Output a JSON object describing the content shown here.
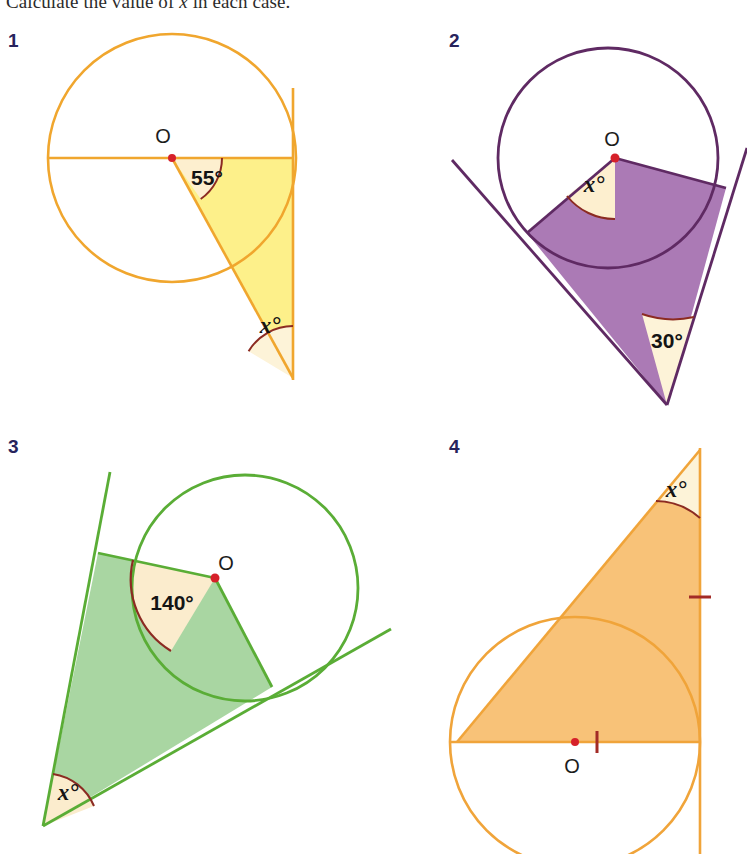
{
  "page": {
    "width": 747,
    "height": 854,
    "background": "#ffffff",
    "heading_part1": "Calculate the value of ",
    "heading_var": "x",
    "heading_part2": " in each case."
  },
  "palette": {
    "navy": "#27235c",
    "angle_arc": "#8c2b22",
    "angle_fill": "#fdefcf",
    "center_dot": "#d6212a",
    "tick_mark": "#a32b26",
    "orange_stroke": "#f0a62e",
    "orange_fill": "#fdf08a",
    "purple_stroke": "#5f2a63",
    "purple_fill": "#ab7ab5",
    "green_stroke": "#5aad36",
    "green_fill": "#a9d6a2",
    "orange4_stroke": "#f0a43a",
    "orange4_fill": "#f8c278"
  },
  "questions": [
    {
      "number": "1",
      "color_name": "orange",
      "center_label": "O",
      "known_angle": "55°",
      "unknown_angle": "x°",
      "geometry": {
        "circle": {
          "cx": 172,
          "cy": 158,
          "r": 124
        },
        "center": {
          "cx": 172,
          "cy": 158
        },
        "radius_horizontal_end": {
          "x": 48,
          "y": 158
        },
        "radius_tangentpoint": {
          "x": 293,
          "y": 158
        },
        "radius_angled_end": {
          "x": 273,
          "y": 260
        },
        "tangent_line": {
          "x1": 293,
          "y1": 88,
          "x2": 293,
          "y2": 380
        },
        "apex": {
          "x": 293,
          "y": 378
        },
        "known_angle_at": "centre",
        "known_angle_value": 55,
        "unknown_angle_at": "apex"
      }
    },
    {
      "number": "2",
      "color_name": "purple",
      "center_label": "O",
      "known_angle": "30°",
      "unknown_angle": "x°",
      "geometry": {
        "circle": {
          "cx": 608,
          "cy": 158,
          "r": 110
        },
        "center": {
          "cx": 615,
          "cy": 158
        },
        "tangent_point_left": {
          "x": 527,
          "y": 233
        },
        "tangent_point_right": {
          "x": 726,
          "y": 188
        },
        "apex": {
          "x": 667,
          "y": 405
        },
        "tangent_left_far": {
          "x": 452,
          "y": 160
        },
        "tangent_right_far": {
          "x": 747,
          "y": 150
        },
        "known_angle_at": "apex",
        "known_angle_value": 30,
        "unknown_angle_at": "centre"
      }
    },
    {
      "number": "3",
      "color_name": "green",
      "center_label": "O",
      "known_angle": "140°",
      "unknown_angle": "x°",
      "geometry": {
        "circle": {
          "cx": 245,
          "cy": 588,
          "r": 113
        },
        "center": {
          "cx": 215,
          "cy": 578
        },
        "tangent_point_left": {
          "x": 98,
          "y": 553
        },
        "tangent_point_right": {
          "x": 272,
          "y": 687
        },
        "apex": {
          "x": 43,
          "y": 826
        },
        "tangent_left_far": {
          "x": 110,
          "y": 472
        },
        "tangent_right_far": {
          "x": 391,
          "y": 633
        },
        "known_angle_at": "centre",
        "known_angle_value": 140,
        "unknown_angle_at": "apex"
      }
    },
    {
      "number": "4",
      "color_name": "orange",
      "center_label": "O",
      "unknown_angle": "x°",
      "equal_tick_marks": 2,
      "geometry": {
        "circle": {
          "cx": 575,
          "cy": 742,
          "r": 125
        },
        "center": {
          "cx": 575,
          "cy": 742
        },
        "diameter_left": {
          "x": 457,
          "y": 742
        },
        "diameter_right": {
          "x": 700,
          "y": 742
        },
        "apex": {
          "x": 700,
          "y": 450
        },
        "tangent_line": {
          "x1": 700,
          "y1": 448,
          "x2": 700,
          "y2": 854
        },
        "tick_on_diameter": {
          "x": 597,
          "y": 742
        },
        "tick_on_tangent": {
          "x": 700,
          "y": 597
        },
        "unknown_angle_at": "apex"
      }
    }
  ]
}
